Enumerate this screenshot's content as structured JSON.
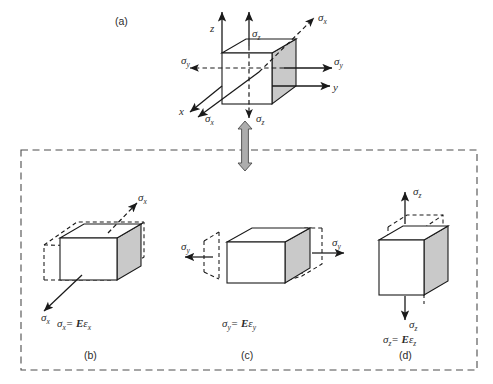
{
  "figure": {
    "title_label": "(a)",
    "background": "#ffffff",
    "line_color": "#1a1a1a",
    "face_gray": "#c9c9c9",
    "face_white": "#ffffff",
    "dashed_border_color": "#4d4d4d",
    "connector_arrow_color": "#a8a8a8"
  },
  "panel_a": {
    "label": "(a)",
    "axes": [
      {
        "name": "z-axis-label",
        "text": "z"
      },
      {
        "name": "y-axis-label",
        "text": "y"
      },
      {
        "name": "x-axis-label",
        "text": "x"
      }
    ],
    "stress_labels": [
      {
        "name": "sigma-x-top-right",
        "sym": "σ",
        "sub": "x"
      },
      {
        "name": "sigma-z-top",
        "sym": "σ",
        "sub": "z"
      },
      {
        "name": "sigma-y-left",
        "sym": "σ",
        "sub": "y"
      },
      {
        "name": "sigma-y-right",
        "sym": "σ",
        "sub": "y"
      },
      {
        "name": "sigma-x-bottom-left",
        "sym": "σ",
        "sub": "x"
      },
      {
        "name": "sigma-z-bottom",
        "sym": "σ",
        "sub": "z"
      }
    ]
  },
  "panel_b": {
    "label": "(b)",
    "equation": {
      "lhs_sym": "σ",
      "lhs_sub": "x",
      "eq": "=",
      "modulus": "E",
      "strain_sym": "ε",
      "strain_sub": "x"
    },
    "stress_labels": [
      {
        "name": "sigma-x-upper",
        "sym": "σ",
        "sub": "x"
      },
      {
        "name": "sigma-x-lower",
        "sym": "σ",
        "sub": "x"
      }
    ]
  },
  "panel_c": {
    "label": "(c)",
    "equation": {
      "lhs_sym": "σ",
      "lhs_sub": "y",
      "eq": "=",
      "modulus": "E",
      "strain_sym": "ε",
      "strain_sub": "y"
    },
    "stress_labels": [
      {
        "name": "sigma-y-left",
        "sym": "σ",
        "sub": "y"
      },
      {
        "name": "sigma-y-right",
        "sym": "σ",
        "sub": "y"
      }
    ]
  },
  "panel_d": {
    "label": "(d)",
    "equation": {
      "lhs_sym": "σ",
      "lhs_sub": "z",
      "eq": "=",
      "modulus": "E",
      "strain_sym": "ε",
      "strain_sub": "z"
    },
    "stress_labels": [
      {
        "name": "sigma-z-top",
        "sym": "σ",
        "sub": "z"
      },
      {
        "name": "sigma-z-bottom",
        "sym": "σ",
        "sub": "z"
      }
    ]
  }
}
